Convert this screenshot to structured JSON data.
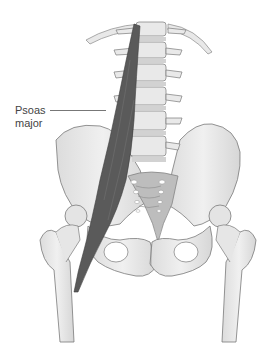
{
  "figure": {
    "labels": [
      {
        "id": "psoas-major",
        "line1": "Psoas",
        "line2": "major"
      }
    ]
  },
  "colors": {
    "bone_fill": "#e6e6e6",
    "bone_outline": "#7a7a7a",
    "sacrum_fill": "#b9b9b9",
    "muscle_fill": "#5a5a5a",
    "label_text": "#444444",
    "background": "#ffffff"
  }
}
